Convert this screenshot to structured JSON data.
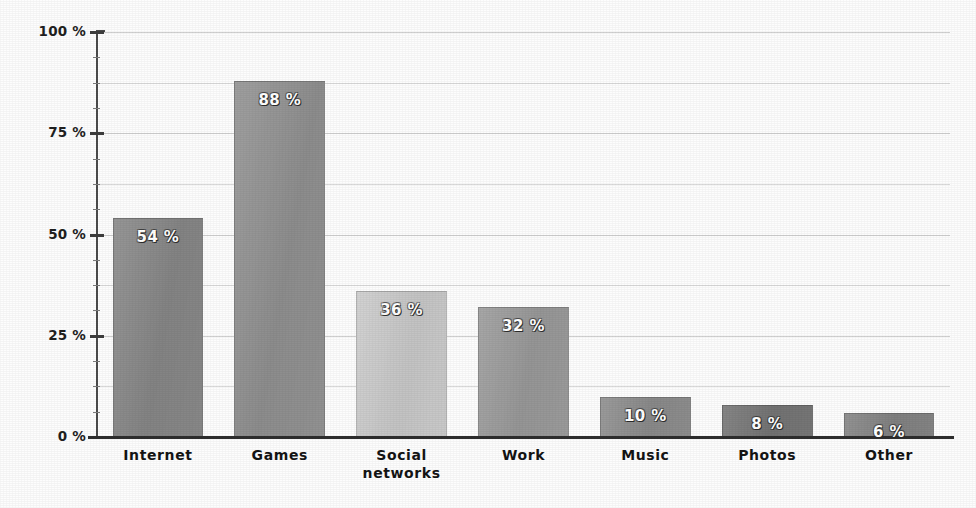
{
  "chart_data": {
    "type": "bar",
    "title": "",
    "subtitle": "",
    "xlabel": "",
    "ylabel": "",
    "categories": [
      "Internet",
      "Games",
      "Social\nnetworks",
      "Work",
      "Music",
      "Photos",
      "Other"
    ],
    "values": [
      54,
      88,
      36,
      32,
      10,
      8,
      6
    ],
    "value_labels": [
      "54 %",
      "88 %",
      "36 %",
      "32 %",
      "10 %",
      "8 %",
      "6 %"
    ],
    "bar_colors": [
      "#8a8a8a",
      "#949494",
      "#cdcdcd",
      "#9d9d9d",
      "#8f8f8f",
      "#787878",
      "#868686"
    ],
    "ylim": [
      0,
      100
    ],
    "y_ticks": [
      0,
      25,
      50,
      75,
      100
    ],
    "y_tick_labels": [
      "0 %",
      "25 %",
      "50 %",
      "75 %",
      "100 %"
    ],
    "y_minor_ticks": [
      6.25,
      12.5,
      18.75,
      31.25,
      37.5,
      43.75,
      56.25,
      62.5,
      68.75,
      81.25,
      87.5,
      93.75
    ],
    "gridlines": [
      12.5,
      25,
      37.5,
      50,
      62.5,
      75,
      87.5,
      100
    ],
    "grid": true,
    "legend": "none",
    "value_label_position": "inside-top",
    "background_color": "#fdfdfd",
    "axis_color": "#2e2e2e",
    "grid_color": "#d9d9d9",
    "label_text_color": "#141414",
    "value_text_color": "#ffffff"
  }
}
